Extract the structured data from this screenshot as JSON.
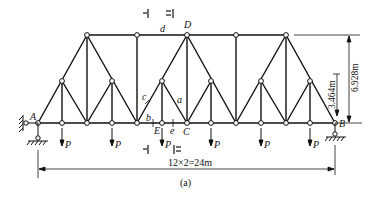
{
  "figure": {
    "caption": "(a)",
    "type": "Truss diagram"
  },
  "labels": {
    "support_left": "A",
    "support_right": "B",
    "top_node": "D",
    "bottom_node_c": "C",
    "bottom_node_e": "E",
    "member_a": "a",
    "member_b": "b",
    "member_c": "c",
    "member_d": "d",
    "member_e": "e",
    "load": "P"
  },
  "dimensions": {
    "span": "12×2=24m",
    "total_height": "6.928m",
    "mid_height": "3.464m"
  },
  "sections": {
    "section_1": "Ⅰ",
    "section_2": "Ⅱ"
  },
  "loads": {
    "count": 6,
    "symbol": "P"
  }
}
